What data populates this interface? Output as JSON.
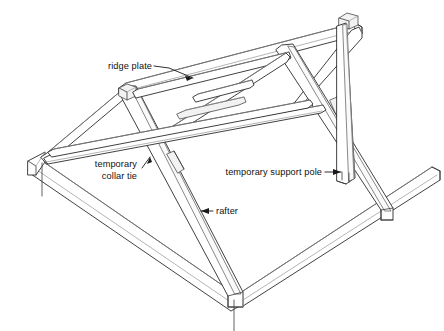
{
  "figure": {
    "kind": "technical-line-drawing",
    "background_color": "#ffffff",
    "line_color": "#2b2b2b",
    "shade_color": "#f2f2f2"
  },
  "callouts": {
    "ridge_plate": {
      "line1": "ridge plate",
      "line2": "",
      "anchor": "end"
    },
    "temporary_collar_tie": {
      "line1": "temporary",
      "line2": "collar tie",
      "anchor": "end"
    },
    "temporary_support_pole": {
      "line1": "temporary support pole",
      "line2": "",
      "anchor": "end"
    },
    "rafter": {
      "line1": "rafter",
      "line2": "",
      "anchor": "start"
    }
  },
  "parts": [
    {
      "id": "ridge-plate",
      "name": "ridge plate"
    },
    {
      "id": "near-rafter",
      "name": "rafter"
    },
    {
      "id": "far-rafter",
      "name": "rafter"
    },
    {
      "id": "temporary-collar-tie",
      "name": "temporary collar tie"
    },
    {
      "id": "temporary-support-pole",
      "name": "temporary support pole"
    },
    {
      "id": "wall-plate-left",
      "name": "wall plate"
    },
    {
      "id": "wall-plate-right",
      "name": "wall plate"
    },
    {
      "id": "diagonal-brace",
      "name": "diagonal brace"
    }
  ]
}
